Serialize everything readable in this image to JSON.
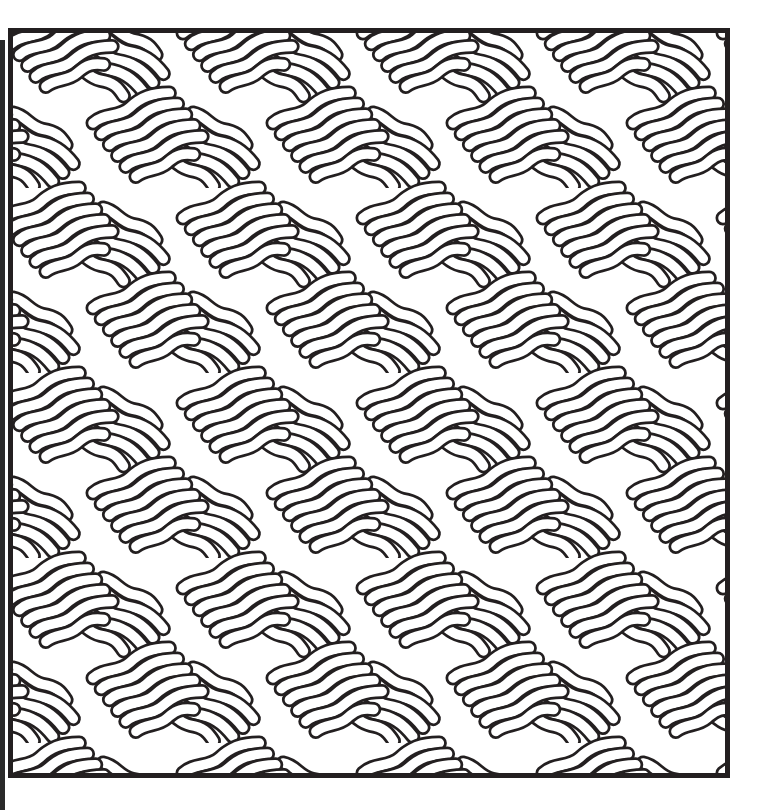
{
  "artwork": {
    "title": "Wavy noodle tessellation coloring page",
    "style": "black line art on white",
    "stroke_color": "#231f20",
    "fill_color": "#ffffff",
    "frame": {
      "x": 8,
      "y": 28,
      "width": 722,
      "height": 750,
      "border_px": 5
    },
    "pattern": {
      "motif": "bundles of wavy rounded tubes",
      "repeat_px": 180,
      "bundle_orientations_deg": [
        -22,
        30
      ]
    }
  }
}
